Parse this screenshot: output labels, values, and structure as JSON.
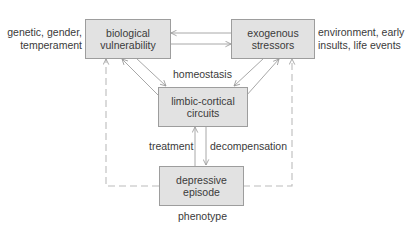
{
  "diagram": {
    "nodes": {
      "biological": {
        "line1": "biological",
        "line2": "vulnerability"
      },
      "exogenous": {
        "line1": "exogenous",
        "line2": "stressors"
      },
      "limbic": {
        "line1": "limbic-cortical",
        "line2": "circuits"
      },
      "depressive": {
        "line1": "depressive",
        "line2": "episode"
      }
    },
    "annotations": {
      "biological_factors": {
        "line1": "genetic, gender,",
        "line2": "temperament"
      },
      "exogenous_factors": {
        "line1": "environment, early",
        "line2": "insults, life events"
      },
      "homeostasis": "homeostasis",
      "treatment": "treatment",
      "decompensation": "decompensation",
      "phenotype": "phenotype"
    },
    "edges": [
      {
        "from": "exogenous",
        "to": "biological",
        "style": "solid"
      },
      {
        "from": "biological",
        "to": "exogenous",
        "style": "solid"
      },
      {
        "from": "biological",
        "to": "limbic",
        "style": "solid"
      },
      {
        "from": "limbic",
        "to": "biological",
        "style": "solid"
      },
      {
        "from": "exogenous",
        "to": "limbic",
        "style": "solid"
      },
      {
        "from": "limbic",
        "to": "exogenous",
        "style": "solid"
      },
      {
        "from": "limbic",
        "to": "depressive",
        "style": "solid",
        "label": "decompensation"
      },
      {
        "from": "depressive",
        "to": "limbic",
        "style": "solid",
        "label": "treatment"
      },
      {
        "from": "depressive",
        "to": "biological",
        "style": "dashed"
      },
      {
        "from": "depressive",
        "to": "exogenous",
        "style": "dashed"
      }
    ],
    "colors": {
      "box_fill": "#e2e2e2",
      "box_border": "#9d9d9d",
      "line": "#a8a8a8",
      "dashed": "#b8b8b8",
      "text": "#3a3a3a"
    }
  }
}
